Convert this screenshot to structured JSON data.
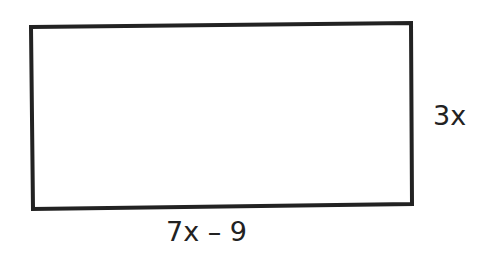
{
  "diagram": {
    "shape": "rectangle",
    "stroke_color": "#222222",
    "labels": {
      "height": "3x",
      "width": "7x – 9"
    }
  }
}
